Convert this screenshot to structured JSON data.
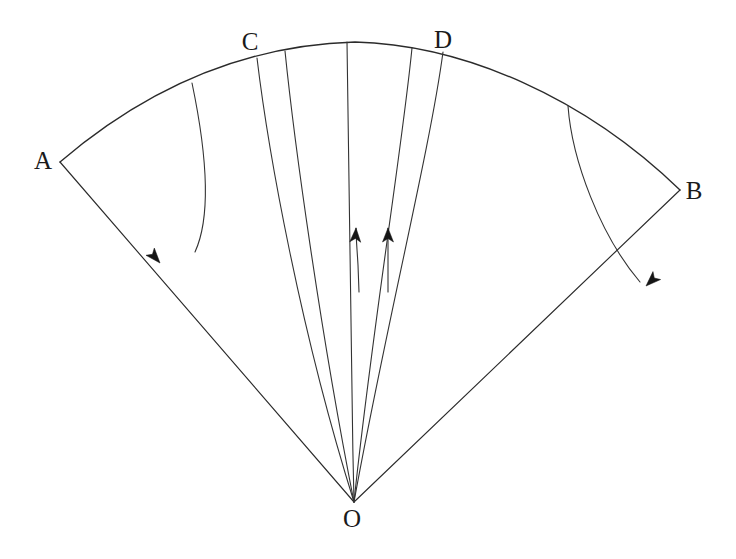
{
  "figure": {
    "kind": "geometry-diagram",
    "background_color": "#ffffff",
    "ink_color": "#2b2b2b",
    "width": 736,
    "height": 559
  },
  "labels": {
    "apex": {
      "text": "O",
      "x": 352,
      "y": 521
    },
    "arc_left": {
      "text": "A",
      "x": 43,
      "y": 163
    },
    "arc_right": {
      "text": "B",
      "x": 694,
      "y": 193
    },
    "arc_inner_left": {
      "text": "C",
      "x": 250,
      "y": 44
    },
    "arc_inner_right": {
      "text": "D",
      "x": 443,
      "y": 42
    }
  },
  "geometry": {
    "apex_point": {
      "x": 354,
      "y": 502
    },
    "outer_arc": {
      "start": {
        "x": 60,
        "y": 162
      },
      "crest": {
        "x": 355,
        "y": 42
      },
      "end": {
        "x": 680,
        "y": 190
      },
      "path": "M 60 162 C 150 85, 250 45, 355 42 C 465 45, 585 98, 680 190"
    },
    "radius_OA": {
      "path": "M 354 502 L 60 162",
      "arrow_at": {
        "x": 160,
        "y": 263
      },
      "arrow_angle_deg": 229
    },
    "radius_OB": {
      "path": "M 354 502 L 680 190",
      "arrow_at": {
        "x": 646,
        "y": 286
      },
      "arrow_angle_deg": 316
    },
    "streamlines": [
      {
        "id": "s1",
        "arc_x": 192,
        "arc_y": 83,
        "terminates": "apex",
        "path": "M 192 83 C 206 150, 212 215, 195 252"
      },
      {
        "id": "s2",
        "arc_x": 257,
        "arc_y": 58,
        "terminates": "apex",
        "path": "M 257 58 C 268 150, 300 330, 354 502"
      },
      {
        "id": "s3",
        "arc_x": 285,
        "arc_y": 51,
        "terminates": "apex",
        "path": "M 285 51 C 294 140, 320 330, 354 502"
      },
      {
        "id": "s4",
        "arc_x": 347,
        "arc_y": 42,
        "terminates": "apex",
        "path": "M 347 42 C 348 150, 350 330, 354 502"
      },
      {
        "id": "s5",
        "arc_x": 412,
        "arc_y": 48,
        "terminates": "apex",
        "path": "M 412 48 C 402 150, 372 330, 354 502"
      },
      {
        "id": "s6",
        "arc_x": 443,
        "arc_y": 52,
        "terminates": "apex",
        "path": "M 443 52 C 430 150, 385 330, 354 502"
      },
      {
        "id": "s7",
        "arc_x": 568,
        "arc_y": 106,
        "terminates": "crossing",
        "path": "M 568 106 C 572 160, 600 235, 640 282"
      }
    ],
    "inner_flow_arrows": [
      {
        "id": "f1",
        "tip": {
          "x": 356,
          "y": 228
        },
        "tail_end": {
          "x": 359,
          "y": 292
        },
        "path": "M 359 292 L 358 265 C 357 248, 356 238, 356 228"
      },
      {
        "id": "f2",
        "tip": {
          "x": 388,
          "y": 228
        },
        "tail_end": {
          "x": 388,
          "y": 292
        },
        "path": "M 388 292 L 388 228"
      }
    ]
  }
}
